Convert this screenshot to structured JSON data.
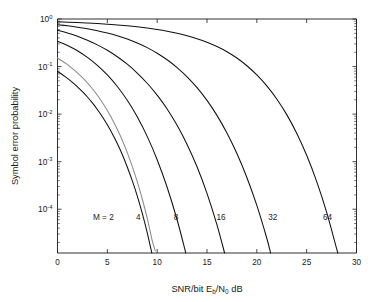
{
  "chart_data": {
    "type": "line",
    "title": "",
    "xlabel": "SNR/bit E_b/N_0 dB",
    "xlabel_parts": {
      "lead": "SNR/bit E",
      "sub1": "b",
      "mid": "/N",
      "sub2": "0",
      "tail": " dB"
    },
    "ylabel": "Symbol error probability",
    "xscale": "linear",
    "yscale": "log",
    "xlim": [
      0,
      30
    ],
    "ylim": [
      1.2e-05,
      1
    ],
    "grid": false,
    "legend": "inline annotations on curves",
    "xticks": [
      0,
      5,
      10,
      15,
      20,
      25,
      30
    ],
    "xtick_labels": [
      "0",
      "5",
      "10",
      "15",
      "20",
      "25",
      "30"
    ],
    "yticks": [
      1,
      0.1,
      0.01,
      0.001,
      0.0001
    ],
    "ytick_labels": [
      "10^0",
      "10^-1",
      "10^-2",
      "10^-3",
      "10^-4"
    ],
    "ytick_mantissas": [
      "10",
      "10",
      "10",
      "10",
      "10"
    ],
    "ytick_exponents": [
      "0",
      "-1",
      "-2",
      "-3",
      "-4"
    ],
    "annotations": [
      {
        "text": "M = 2",
        "x_db": 4.6,
        "y_prob": 5.8e-05
      },
      {
        "text": "4",
        "x_db": 8.1,
        "y_prob": 5.8e-05
      },
      {
        "text": "8",
        "x_db": 11.9,
        "y_prob": 5.8e-05
      },
      {
        "text": "16",
        "x_db": 16.4,
        "y_prob": 5.8e-05
      },
      {
        "text": "32",
        "x_db": 21.6,
        "y_prob": 5.8e-05
      },
      {
        "text": "64",
        "x_db": 27.1,
        "y_prob": 5.8e-05
      }
    ],
    "series": [
      {
        "name": "M = 2",
        "color": "#111111",
        "x": [
          0,
          0.5,
          1,
          1.5,
          2,
          2.5,
          3,
          3.5,
          4,
          4.5,
          5,
          5.5,
          6,
          6.5,
          7,
          7.5,
          8,
          8.5,
          9,
          9.5
        ],
        "y": [
          0.0786,
          0.0671,
          0.0563,
          0.0463,
          0.0375,
          0.0296,
          0.0229,
          0.0172,
          0.0125,
          0.00879,
          0.00595,
          0.00387,
          0.0024,
          0.00141,
          0.000773,
          0.000398,
          0.000191,
          8.28e-05,
          3.23e-05,
          1.11e-05
        ]
      },
      {
        "name": "M = 4",
        "color": "#8c8c8c",
        "x": [
          0,
          0.5,
          1,
          1.5,
          2,
          2.5,
          3,
          3.5,
          4,
          4.5,
          5,
          5.5,
          6,
          6.5,
          7,
          7.5,
          8,
          8.5,
          9,
          9.5,
          9.8
        ],
        "y": [
          0.151,
          0.1296,
          0.1094,
          0.0904,
          0.0736,
          0.0583,
          0.0453,
          0.0341,
          0.0249,
          0.0175,
          0.0119,
          0.00773,
          0.0048,
          0.00282,
          0.00155,
          0.000796,
          0.000382,
          0.000166,
          6.46e-05,
          2.22e-05,
          1.34e-05
        ]
      },
      {
        "name": "M = 8",
        "color": "#111111",
        "x": [
          0,
          1,
          2,
          3,
          4,
          5,
          6,
          7,
          8,
          9,
          10,
          11,
          12,
          13,
          13.3
        ],
        "y": [
          0.34,
          0.278,
          0.215,
          0.156,
          0.106,
          0.0665,
          0.038,
          0.0195,
          0.0088,
          0.0034,
          0.0011,
          0.00029,
          6e-05,
          9.5e-06,
          6e-06
        ]
      },
      {
        "name": "M = 16",
        "color": "#111111",
        "x": [
          0,
          1,
          2,
          3,
          4,
          5,
          6,
          7,
          8,
          9,
          10,
          11,
          12,
          13,
          14,
          15,
          16,
          17,
          18,
          18.1
        ],
        "y": [
          0.58,
          0.508,
          0.433,
          0.358,
          0.286,
          0.22,
          0.161,
          0.112,
          0.073,
          0.0445,
          0.025,
          0.0128,
          0.0058,
          0.0023,
          0.00078,
          0.000215,
          4.7e-05,
          7.9e-06,
          1.1e-06,
          1e-06
        ]
      },
      {
        "name": "M = 32",
        "color": "#111111",
        "x": [
          0,
          1,
          2,
          3,
          4,
          5,
          6,
          7,
          8,
          9,
          10,
          11,
          12,
          13,
          14,
          15,
          16,
          17,
          18,
          19,
          20,
          21,
          22,
          23,
          23.4
        ],
        "y": [
          0.76,
          0.718,
          0.672,
          0.621,
          0.565,
          0.505,
          0.442,
          0.378,
          0.313,
          0.25,
          0.191,
          0.139,
          0.095,
          0.0608,
          0.036,
          0.0194,
          0.0094,
          0.004,
          0.00148,
          0.000465,
          0.00012,
          2.45e-05,
          3.8e-06,
          4.5e-07,
          2e-07
        ]
      },
      {
        "name": "M = 64",
        "color": "#111111",
        "x": [
          0,
          1,
          2,
          3,
          4,
          5,
          6,
          7,
          8,
          9,
          10,
          11,
          12,
          13,
          14,
          15,
          16,
          17,
          18,
          19,
          20,
          21,
          22,
          23,
          24,
          25,
          26,
          27,
          28,
          28.5
        ],
        "y": [
          0.87,
          0.856,
          0.84,
          0.822,
          0.801,
          0.777,
          0.75,
          0.719,
          0.684,
          0.645,
          0.601,
          0.553,
          0.5,
          0.444,
          0.385,
          0.324,
          0.263,
          0.205,
          0.151,
          0.104,
          0.0668,
          0.0393,
          0.0208,
          0.00975,
          0.00396,
          0.00136,
          0.000385,
          8.7e-05,
          1.5e-05,
          6e-06
        ]
      }
    ]
  }
}
